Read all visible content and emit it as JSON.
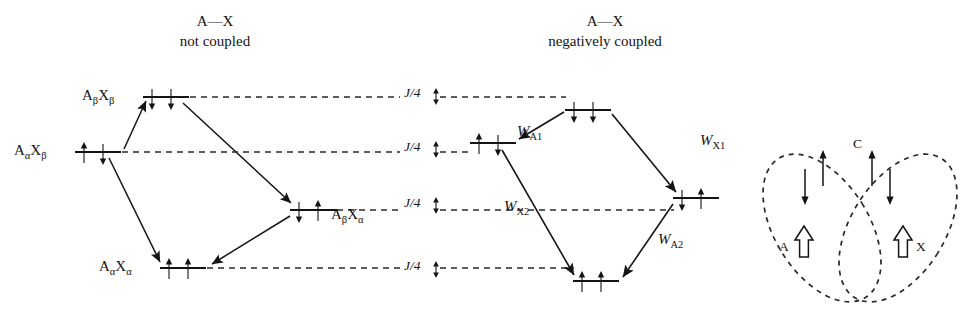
{
  "figure": {
    "type": "energy-level-diagram"
  },
  "panels": {
    "left": {
      "title_line1": "A—X",
      "title_line2": "not coupled",
      "levels": [
        {
          "id": "abxb",
          "label_A": "A",
          "label_Asub": "β",
          "label_X": "X",
          "label_Xsub": "β",
          "label_text": "AβXβ",
          "label_side": "left",
          "spins": [
            "down",
            "down"
          ],
          "x": 143,
          "y": 97,
          "w": 46
        },
        {
          "id": "aaxb",
          "label_text": "AαXβ",
          "label_side": "left",
          "spins": [
            "up",
            "down"
          ],
          "x": 75,
          "y": 152,
          "w": 46
        },
        {
          "id": "abxa",
          "label_text": "AβXα",
          "label_side": "right",
          "spins": [
            "down",
            "up"
          ],
          "x": 290,
          "y": 210,
          "w": 46
        },
        {
          "id": "aaxa",
          "label_text": "AαXα",
          "label_side": "left",
          "spins": [
            "up",
            "up"
          ],
          "x": 160,
          "y": 268,
          "w": 46
        }
      ]
    },
    "right": {
      "title_line1": "A—X",
      "title_line2": "negatively coupled",
      "levels": [
        {
          "id": "abxb",
          "spins": [
            "down",
            "down"
          ],
          "x": 565,
          "y": 110,
          "w": 46
        },
        {
          "id": "aaxb",
          "spins": [
            "up",
            "down"
          ],
          "x": 470,
          "y": 143,
          "w": 46
        },
        {
          "id": "abxa",
          "spins": [
            "down",
            "up"
          ],
          "x": 673,
          "y": 198,
          "w": 46
        },
        {
          "id": "aaxa",
          "spins": [
            "up",
            "up"
          ],
          "x": 573,
          "y": 281,
          "w": 46
        }
      ],
      "transitions": [
        {
          "name": "W_A1",
          "text": "W",
          "sub": "A1",
          "lx": 517,
          "ly": 131
        },
        {
          "name": "W_X1",
          "text": "W",
          "sub": "X1",
          "lx": 700,
          "ly": 140
        },
        {
          "name": "W_X2",
          "text": "W",
          "sub": "X2",
          "lx": 508,
          "ly": 206
        },
        {
          "name": "W_A2",
          "text": "W",
          "sub": "A2",
          "lx": 662,
          "ly": 239
        }
      ]
    }
  },
  "j_markers": [
    {
      "text": "J/4",
      "x": 404,
      "y": 93,
      "dir": "down"
    },
    {
      "text": "J/4",
      "x": 404,
      "y": 147,
      "dir": "up"
    },
    {
      "text": "J/4",
      "x": 404,
      "y": 203,
      "dir": "up"
    },
    {
      "text": "J/4",
      "x": 404,
      "y": 277,
      "dir": "down"
    }
  ],
  "cartoon": {
    "label_A": "A",
    "label_X": "X",
    "label_C": "C",
    "arrows": [
      {
        "id": "a-hollow",
        "kind": "hollow-up"
      },
      {
        "id": "a-down",
        "kind": "down"
      },
      {
        "id": "a-up",
        "kind": "up"
      },
      {
        "id": "x-up",
        "kind": "up"
      },
      {
        "id": "x-down",
        "kind": "down"
      },
      {
        "id": "x-hollow",
        "kind": "hollow-up"
      }
    ]
  },
  "colors": {
    "ink": "#141414",
    "line": "#1a1a1a",
    "dashed": "#2a2a2a",
    "background": "#ffffff"
  }
}
